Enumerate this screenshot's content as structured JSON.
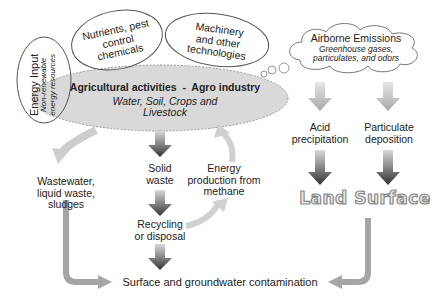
{
  "diagram": {
    "central": {
      "title": "Agricultural activities  -  Agro industry",
      "subtitle_line1": "Water, Soil, Crops and",
      "subtitle_line2": "Livestock"
    },
    "inputs": {
      "energy": {
        "title": "Energy Input",
        "subtitle_line1": "Non-renewable",
        "subtitle_line2": "energy resources"
      },
      "nutrients": {
        "line1": "Nutrients, pest",
        "line2": "control",
        "line3": "chemicals"
      },
      "machinery": {
        "line1": "Machinery",
        "line2": "and other",
        "line3": "technologies"
      }
    },
    "emissions": {
      "title": "Airborne Emissions",
      "line1": "Greenhouse gases,",
      "line2": "particulates, and odors"
    },
    "nodes": {
      "acid": {
        "line1": "Acid",
        "line2": "precipitation"
      },
      "particulate": {
        "line1": "Particulate",
        "line2": "deposition"
      },
      "land_surface": "Land Surface",
      "wastewater": {
        "line1": "Wastewater,",
        "line2": "liquid waste,",
        "line3": "sludges"
      },
      "solid_waste": {
        "line1": "Solid",
        "line2": "waste"
      },
      "energy_methane": {
        "line1": "Energy",
        "line2": "production from",
        "line3": "methane"
      },
      "recycling": {
        "line1": "Recycling",
        "line2": "or disposal"
      },
      "contamination": "Surface and groundwater contamination"
    },
    "colors": {
      "ellipse_fill": "#d9d9d9",
      "arrow_light": "#c8c8c8",
      "arrow_dark": "#3c3c3c",
      "connector": "#a0a0a0"
    }
  }
}
